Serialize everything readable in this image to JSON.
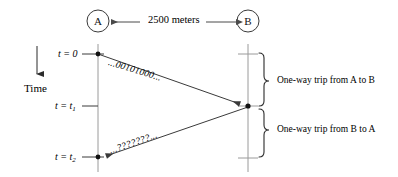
{
  "figure": {
    "nodes": [
      {
        "id": "A",
        "label": "A",
        "cx": 98,
        "cy": 21,
        "r": 11
      },
      {
        "id": "B",
        "label": "B",
        "cx": 248,
        "cy": 21,
        "r": 11
      }
    ],
    "distance": {
      "label": "2500 meters",
      "arrow_from_x": 239,
      "arrow_to_x": 110,
      "y": 22
    },
    "time_axis": {
      "label": "Time",
      "arrow_x": 37,
      "arrow_top_y": 47,
      "arrow_bottom_y": 78,
      "direction": "down"
    },
    "timeline_a": {
      "x": 98,
      "top_y": 44,
      "bottom_y": 172
    },
    "timeline_b": {
      "x": 248,
      "top_y": 44,
      "bottom_y": 172
    },
    "ticks": [
      {
        "id": "t0",
        "text": "t = 0",
        "symbol": "t",
        "equals": "=",
        "value": "0",
        "sub": "",
        "y": 54
      },
      {
        "id": "t1",
        "text": "t = t1",
        "symbol": "t",
        "equals": "=",
        "value": "t",
        "sub": "1",
        "y": 106
      },
      {
        "id": "t2",
        "text": "t = t2",
        "symbol": "t",
        "equals": "=",
        "value": "t",
        "sub": "2",
        "y": 157
      }
    ],
    "messages": [
      {
        "id": "a-to-b",
        "text": "...00101000...",
        "from": {
          "x": 98,
          "y": 54
        },
        "to": {
          "x": 248,
          "y": 106
        },
        "rotation_deg": 17
      },
      {
        "id": "b-to-a",
        "text": "...???????...",
        "from": {
          "x": 248,
          "y": 106
        },
        "to": {
          "x": 98,
          "y": 157
        },
        "rotation_deg": -19
      }
    ],
    "braces": [
      {
        "id": "brace-a-to-b",
        "label": "One-way trip from A to B",
        "top_y": 53,
        "bottom_y": 106,
        "x": 258
      },
      {
        "id": "brace-b-to-a",
        "label": "One-way trip from B to A",
        "top_y": 108,
        "bottom_y": 161,
        "x": 258
      }
    ],
    "colors": {
      "ink": "#1a1a1a",
      "line": "#4a4a4a",
      "timeline": "#8a8a8a",
      "background": "#ffffff"
    }
  }
}
